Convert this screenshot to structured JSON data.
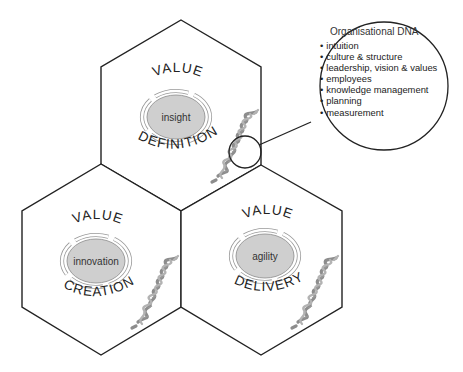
{
  "diagram": {
    "hexagons": [
      {
        "id": "definition",
        "top_word": "VALUE",
        "bottom_word": "DEFINITION",
        "core_label": "insight"
      },
      {
        "id": "creation",
        "top_word": "VALUE",
        "bottom_word": "CREATION",
        "core_label": "innovation"
      },
      {
        "id": "delivery",
        "top_word": "VALUE",
        "bottom_word": "DELIVERY",
        "core_label": "agility"
      }
    ],
    "callout": {
      "title": "Organisational DNA",
      "items": [
        "intuition",
        "culture & structure",
        "leadership, vision & values",
        "employees",
        "knowledge management",
        "planning",
        "measurement"
      ]
    },
    "colors": {
      "stroke": "#222222",
      "core_fill": "#cfcfcf",
      "dna": "#8d8d8d",
      "background": "#ffffff"
    }
  }
}
